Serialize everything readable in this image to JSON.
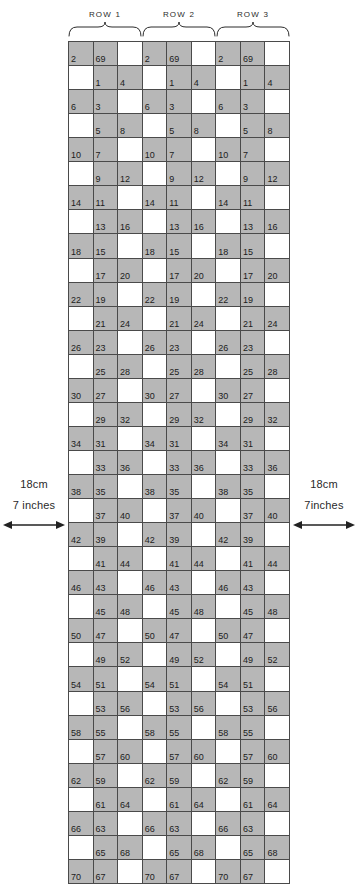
{
  "chart_data": {
    "type": "table",
    "columns": 9,
    "rows": 31,
    "row_group_labels": [
      "ROW 1",
      "ROW 2",
      "ROW 3"
    ],
    "repeat_blocks": 3,
    "columns_per_block": 3,
    "legend": {
      "shaded": "#b7b7b7",
      "unshaded": "#ffffff",
      "grid_line": "#4a4a4a"
    },
    "block_pattern": [
      {
        "grid_row": 1,
        "shaded_cols": [
          0,
          1
        ],
        "labels": {
          "0": "2",
          "1": "69"
        }
      },
      {
        "grid_row": 2,
        "shaded_cols": [
          1,
          2
        ],
        "labels": {
          "1": "1",
          "2": "4"
        }
      },
      {
        "grid_row": 3,
        "shaded_cols": [
          0,
          1
        ],
        "labels": {
          "0": "6",
          "1": "3"
        }
      },
      {
        "grid_row": 4,
        "shaded_cols": [
          1,
          2
        ],
        "labels": {
          "1": "5",
          "2": "8"
        }
      },
      {
        "grid_row": 5,
        "shaded_cols": [
          0,
          1
        ],
        "labels": {
          "0": "10",
          "1": "7"
        }
      },
      {
        "grid_row": 6,
        "shaded_cols": [
          1,
          2
        ],
        "labels": {
          "1": "9",
          "2": "12"
        }
      },
      {
        "grid_row": 7,
        "shaded_cols": [
          0,
          1
        ],
        "labels": {
          "0": "14",
          "1": "11"
        }
      },
      {
        "grid_row": 8,
        "shaded_cols": [
          1,
          2
        ],
        "labels": {
          "1": "13",
          "2": "16"
        }
      },
      {
        "grid_row": 9,
        "shaded_cols": [
          0,
          1
        ],
        "labels": {
          "0": "18",
          "1": "15"
        }
      },
      {
        "grid_row": 10,
        "shaded_cols": [
          1,
          2
        ],
        "labels": {
          "1": "17",
          "2": "20"
        }
      },
      {
        "grid_row": 11,
        "shaded_cols": [
          0,
          1
        ],
        "labels": {
          "0": "22",
          "1": "19"
        }
      },
      {
        "grid_row": 12,
        "shaded_cols": [
          1,
          2
        ],
        "labels": {
          "1": "21",
          "2": "24"
        }
      },
      {
        "grid_row": 13,
        "shaded_cols": [
          0,
          1
        ],
        "labels": {
          "0": "26",
          "1": "23"
        }
      },
      {
        "grid_row": 14,
        "shaded_cols": [
          1,
          2
        ],
        "labels": {
          "1": "25",
          "2": "28"
        }
      },
      {
        "grid_row": 15,
        "shaded_cols": [
          0,
          1
        ],
        "labels": {
          "0": "30",
          "1": "27"
        }
      },
      {
        "grid_row": 16,
        "shaded_cols": [
          1,
          2
        ],
        "labels": {
          "1": "29",
          "2": "32"
        }
      },
      {
        "grid_row": 17,
        "shaded_cols": [
          0,
          1
        ],
        "labels": {
          "0": "34",
          "1": "31"
        }
      },
      {
        "grid_row": 18,
        "shaded_cols": [
          1,
          2
        ],
        "labels": {
          "1": "33",
          "2": "36"
        }
      },
      {
        "grid_row": 19,
        "shaded_cols": [
          0,
          1
        ],
        "labels": {
          "0": "38",
          "1": "35"
        }
      },
      {
        "grid_row": 20,
        "shaded_cols": [
          1,
          2
        ],
        "labels": {
          "1": "37",
          "2": "40"
        }
      },
      {
        "grid_row": 21,
        "shaded_cols": [
          0,
          1
        ],
        "labels": {
          "0": "42",
          "1": "39"
        }
      },
      {
        "grid_row": 22,
        "shaded_cols": [
          1,
          2
        ],
        "labels": {
          "1": "41",
          "2": "44"
        }
      },
      {
        "grid_row": 23,
        "shaded_cols": [
          0,
          1
        ],
        "labels": {
          "0": "46",
          "1": "43"
        }
      },
      {
        "grid_row": 24,
        "shaded_cols": [
          1,
          2
        ],
        "labels": {
          "1": "45",
          "2": "48"
        }
      },
      {
        "grid_row": 25,
        "shaded_cols": [
          0,
          1
        ],
        "labels": {
          "0": "50",
          "1": "47"
        }
      },
      {
        "grid_row": 26,
        "shaded_cols": [
          1,
          2
        ],
        "labels": {
          "1": "49",
          "2": "52"
        }
      },
      {
        "grid_row": 27,
        "shaded_cols": [
          0,
          1
        ],
        "labels": {
          "0": "54",
          "1": "51"
        }
      },
      {
        "grid_row": 28,
        "shaded_cols": [
          1,
          2
        ],
        "labels": {
          "1": "53",
          "2": "56"
        }
      },
      {
        "grid_row": 29,
        "shaded_cols": [
          0,
          1
        ],
        "labels": {
          "0": "58",
          "1": "55"
        }
      },
      {
        "grid_row": 30,
        "shaded_cols": [
          1,
          2
        ],
        "labels": {
          "1": "57",
          "2": "60"
        }
      },
      {
        "grid_row": 31,
        "shaded_cols": [
          0,
          1
        ],
        "labels": {
          "0": "62",
          "1": "59"
        }
      },
      {
        "grid_row": 32,
        "shaded_cols": [
          1,
          2
        ],
        "labels": {
          "1": "61",
          "2": "64"
        }
      },
      {
        "grid_row": 33,
        "shaded_cols": [
          0,
          1
        ],
        "labels": {
          "0": "66",
          "1": "63"
        }
      },
      {
        "grid_row": 34,
        "shaded_cols": [
          1,
          2
        ],
        "labels": {
          "1": "65",
          "2": "68"
        }
      },
      {
        "grid_row": 35,
        "shaded_cols": [
          0,
          1
        ],
        "labels": {
          "0": "70",
          "1": "67"
        }
      }
    ]
  },
  "measurements": {
    "left": {
      "metric": "18cm",
      "imperial": "7 inches"
    },
    "right": {
      "metric": "18cm",
      "imperial": "7inches"
    }
  }
}
